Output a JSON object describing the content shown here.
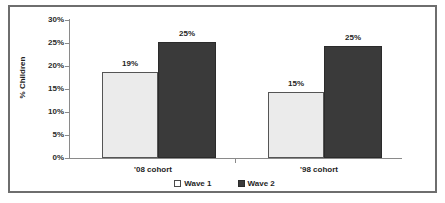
{
  "chart_data": {
    "type": "bar",
    "title": "",
    "xlabel": "",
    "ylabel": "% Children",
    "ylim": [
      0,
      30
    ],
    "ytick_labels": [
      "0%",
      "5%",
      "10%",
      "15%",
      "20%",
      "25%",
      "30%"
    ],
    "ytick_values": [
      0,
      5,
      10,
      15,
      20,
      25,
      30
    ],
    "grid": false,
    "legend_position": "bottom-center",
    "categories": [
      "'08 cohort",
      "'98 cohort"
    ],
    "series": [
      {
        "name": "Wave 1",
        "color": "#ebebeb",
        "values": [
          19,
          15
        ],
        "drawn_values": [
          18.7,
          14.4
        ],
        "labels": [
          "19%",
          "15%"
        ]
      },
      {
        "name": "Wave 2",
        "color": "#3a3a3a",
        "values": [
          25,
          25
        ],
        "drawn_values": [
          25.2,
          24.4
        ],
        "labels": [
          "25%",
          "25%"
        ]
      }
    ]
  },
  "legend": {
    "entries": [
      {
        "label": "Wave 1",
        "swatch": "wave1-swatch"
      },
      {
        "label": "Wave 2",
        "swatch": "wave2-swatch"
      }
    ]
  },
  "colors": {
    "wave1_fill": "#ebebeb",
    "wave2_fill": "#3a3a3a",
    "axis": "#8a8a8a",
    "frame_border": "#6e6e6e",
    "text": "#1f1f1f",
    "background": "#ffffff"
  }
}
